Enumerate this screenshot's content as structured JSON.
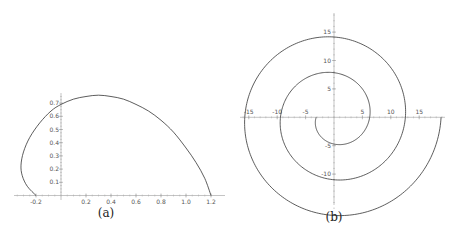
{
  "chart_data": [
    {
      "panel": "a",
      "type": "line",
      "caption": "(a)",
      "title": "",
      "xlabel": "",
      "ylabel": "",
      "xlim": [
        -0.33,
        1.22
      ],
      "ylim": [
        0,
        0.76
      ],
      "grid": false,
      "x_ticks": [
        -0.2,
        0.2,
        0.4,
        0.6,
        0.8,
        1.0,
        1.2
      ],
      "x_tick_labels": [
        "-0.2",
        "0.2",
        "0.4",
        "0.6",
        "0.8",
        "1.0",
        "1.2"
      ],
      "y_ticks": [
        0.1,
        0.2,
        0.3,
        0.4,
        0.5,
        0.6,
        0.7
      ],
      "y_tick_labels": [
        "0.1",
        "0.2",
        "0.3",
        "0.4",
        "0.5",
        "0.6",
        "0.7"
      ],
      "series": [
        {
          "name": "curve",
          "x": [
            -0.2,
            -0.27,
            -0.31,
            -0.32,
            -0.3,
            -0.25,
            -0.17,
            -0.08,
            0.0,
            0.1,
            0.2,
            0.3,
            0.4,
            0.5,
            0.6,
            0.7,
            0.8,
            0.9,
            1.0,
            1.08,
            1.15,
            1.2
          ],
          "y": [
            0.0,
            0.07,
            0.15,
            0.23,
            0.33,
            0.44,
            0.55,
            0.64,
            0.69,
            0.73,
            0.75,
            0.76,
            0.75,
            0.73,
            0.69,
            0.64,
            0.57,
            0.48,
            0.36,
            0.25,
            0.13,
            0.0
          ]
        }
      ]
    },
    {
      "panel": "b",
      "type": "line",
      "caption": "(b)",
      "title": "",
      "xlabel": "",
      "ylabel": "",
      "description": "Archimedean spiral r = theta, theta from pi to 6pi",
      "xlim": [
        -16.5,
        19.5
      ],
      "ylim": [
        -16,
        18
      ],
      "grid": false,
      "x_ticks": [
        -15,
        -10,
        -5,
        5,
        10,
        15
      ],
      "x_tick_labels": [
        "-15",
        "-10",
        "-5",
        "5",
        "10",
        "15"
      ],
      "y_ticks": [
        -10,
        -5,
        5,
        10,
        15
      ],
      "y_tick_labels": [
        "-10",
        "-5",
        "5",
        "10",
        "15"
      ],
      "series": [
        {
          "name": "spiral",
          "theta_start": 3.14159,
          "theta_end": 18.8496,
          "x_axis_crossings": [
            -3.14,
            6.28,
            -9.42,
            12.57,
            -15.71,
            18.85
          ],
          "y_axis_crossings": [
            4.71,
            -7.85,
            11.0,
            -14.14,
            17.28
          ]
        }
      ]
    }
  ],
  "captions": {
    "a": "(a)",
    "b": "(b)"
  }
}
